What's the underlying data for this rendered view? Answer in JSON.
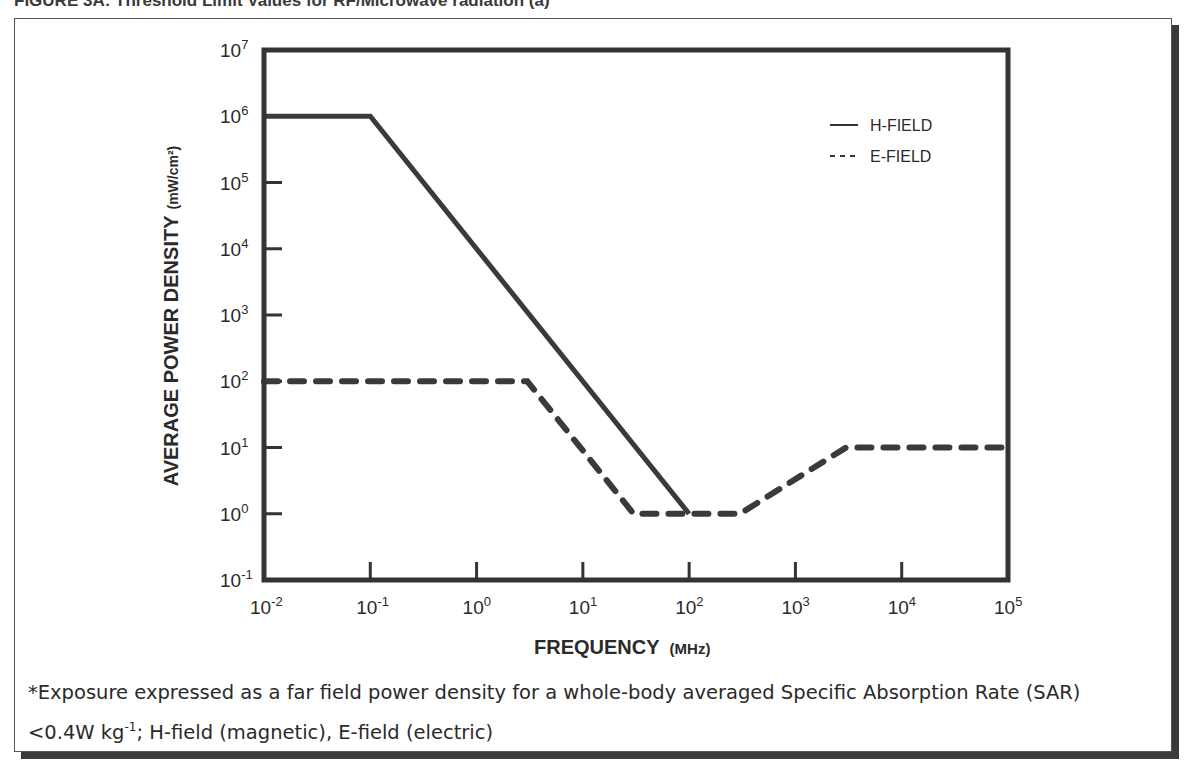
{
  "figure": {
    "title": "FIGURE 3A: Threshold Limit Values for RF/Microwave radiation (a)"
  },
  "footnote": {
    "line1": "*Exposure expressed as a far field power density for a whole-body averaged Specific Absorption Rate (SAR)",
    "line2_prefix": "<0.4W kg",
    "line2_sup": "-1",
    "line2_suffix": "; H-field (magnetic), E-field (electric)"
  },
  "colors": {
    "line": "#3a3a3a",
    "frame": "#333333",
    "shadow": "#3a3a3a"
  },
  "chart_data": {
    "type": "line",
    "title": "Threshold Limit Values for RF/Microwave radiation",
    "xlabel": "FREQUENCY",
    "xlabel_unit": "(MHz)",
    "ylabel": "AVERAGE POWER DENSITY",
    "ylabel_unit": "(mW/cm²)",
    "xscale": "log",
    "yscale": "log",
    "xlim": [
      0.01,
      100000
    ],
    "ylim": [
      0.1,
      10000000
    ],
    "x_ticks": [
      {
        "base": "10",
        "exp": "-2"
      },
      {
        "base": "10",
        "exp": "-1"
      },
      {
        "base": "10",
        "exp": "0"
      },
      {
        "base": "10",
        "exp": "1"
      },
      {
        "base": "10",
        "exp": "2"
      },
      {
        "base": "10",
        "exp": "3"
      },
      {
        "base": "10",
        "exp": "4"
      },
      {
        "base": "10",
        "exp": "5"
      }
    ],
    "y_ticks": [
      {
        "base": "10",
        "exp": "7"
      },
      {
        "base": "10",
        "exp": "6"
      },
      {
        "base": "10",
        "exp": "5"
      },
      {
        "base": "10",
        "exp": "4"
      },
      {
        "base": "10",
        "exp": "3"
      },
      {
        "base": "10",
        "exp": "2"
      },
      {
        "base": "10",
        "exp": "1"
      },
      {
        "base": "10",
        "exp": "0"
      },
      {
        "base": "10",
        "exp": "-1"
      }
    ],
    "grid": false,
    "legend_position": "upper right",
    "series": [
      {
        "name": "H-FIELD",
        "style": "solid",
        "x": [
          0.01,
          0.1,
          100
        ],
        "y": [
          1000000,
          1000000,
          1
        ]
      },
      {
        "name": "E-FIELD",
        "style": "dashed",
        "x": [
          0.01,
          3,
          30,
          300,
          3000,
          100000
        ],
        "y": [
          100,
          100,
          1,
          1,
          10,
          10
        ]
      }
    ]
  }
}
